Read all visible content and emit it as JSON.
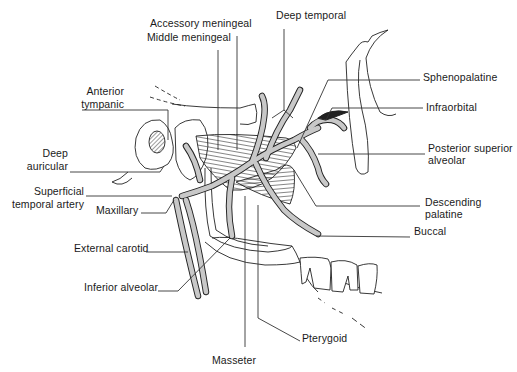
{
  "figure": {
    "colors": {
      "artery_fill": "#c8c8c8",
      "outline": "#222222",
      "leader": "#333333",
      "background": "#ffffff"
    }
  },
  "labels": [
    {
      "id": "accessory-meningeal",
      "text": "Accessory meningeal",
      "x": 150,
      "y": 18,
      "align": "left"
    },
    {
      "id": "middle-meningeal",
      "text": "Middle meningeal",
      "x": 147,
      "y": 32,
      "align": "left"
    },
    {
      "id": "deep-temporal",
      "text": "Deep temporal",
      "x": 276,
      "y": 10,
      "align": "left"
    },
    {
      "id": "sphenopalatine",
      "text": "Sphenopalatine",
      "x": 423,
      "y": 72,
      "align": "left"
    },
    {
      "id": "infraorbital",
      "text": "Infraorbital",
      "x": 426,
      "y": 102,
      "align": "left"
    },
    {
      "id": "posterior-superior-alveolar-line1",
      "text": "Posterior superior",
      "x": 428,
      "y": 143,
      "align": "left"
    },
    {
      "id": "posterior-superior-alveolar-line2",
      "text": "alveolar",
      "x": 428,
      "y": 155,
      "align": "left"
    },
    {
      "id": "descending-palatine-line1",
      "text": "Descending",
      "x": 425,
      "y": 197,
      "align": "left"
    },
    {
      "id": "descending-palatine-line2",
      "text": "palatine",
      "x": 425,
      "y": 209,
      "align": "left"
    },
    {
      "id": "buccal",
      "text": "Buccal",
      "x": 414,
      "y": 226,
      "align": "left"
    },
    {
      "id": "pterygoid",
      "text": "Pterygoid",
      "x": 302,
      "y": 333,
      "align": "left"
    },
    {
      "id": "masseter",
      "text": "Masseter",
      "x": 212,
      "y": 355,
      "align": "left"
    },
    {
      "id": "anterior-tympanic-line1",
      "text": "Anterior",
      "x": 44,
      "y": 86,
      "align": "right",
      "w": 80
    },
    {
      "id": "anterior-tympanic-line2",
      "text": "tympanic",
      "x": 40,
      "y": 99,
      "align": "right",
      "w": 84
    },
    {
      "id": "deep-auricular-line1",
      "text": "Deep",
      "x": 30,
      "y": 148,
      "align": "right",
      "w": 38
    },
    {
      "id": "deep-auricular-line2",
      "text": "auricular",
      "x": 22,
      "y": 161,
      "align": "right",
      "w": 46
    },
    {
      "id": "superficial-temporal-artery-line1",
      "text": "Superficial",
      "x": 30,
      "y": 186,
      "align": "right",
      "w": 54
    },
    {
      "id": "superficial-temporal-artery-line2",
      "text": "temporal artery",
      "x": 10,
      "y": 199,
      "align": "right",
      "w": 74
    },
    {
      "id": "maxillary",
      "text": "Maxillary",
      "x": 96,
      "y": 205,
      "align": "left"
    },
    {
      "id": "external-carotid",
      "text": "External carotid",
      "x": 74,
      "y": 243,
      "align": "left"
    },
    {
      "id": "inferior-alveolar",
      "text": "Inferior alveolar",
      "x": 84,
      "y": 282,
      "align": "left"
    }
  ],
  "leaders": [
    {
      "id": "accessory-meningeal-leader",
      "points": [
        [
          237,
          36
        ],
        [
          237,
          150
        ]
      ]
    },
    {
      "id": "middle-meningeal-leader",
      "points": [
        [
          218,
          50
        ],
        [
          218,
          150
        ]
      ]
    },
    {
      "id": "deep-temporal-leader",
      "points": [
        [
          284,
          29
        ],
        [
          284,
          110
        ],
        [
          272,
          118
        ]
      ]
    },
    {
      "id": "deep-temporal-leader-b",
      "points": [
        [
          284,
          110
        ],
        [
          293,
          118
        ]
      ]
    },
    {
      "id": "sphenopalatine-leader",
      "points": [
        [
          420,
          80
        ],
        [
          328,
          80
        ],
        [
          297,
          148
        ]
      ]
    },
    {
      "id": "infraorbital-leader",
      "points": [
        [
          423,
          108
        ],
        [
          332,
          108
        ],
        [
          326,
          120
        ]
      ]
    },
    {
      "id": "posterior-superior-alveolar-leader",
      "points": [
        [
          425,
          154
        ],
        [
          318,
          154
        ]
      ]
    },
    {
      "id": "descending-palatine-leader",
      "points": [
        [
          420,
          206
        ],
        [
          316,
          206
        ],
        [
          294,
          170
        ]
      ]
    },
    {
      "id": "buccal-leader",
      "points": [
        [
          410,
          237
        ],
        [
          316,
          236
        ]
      ]
    },
    {
      "id": "pterygoid-leader",
      "points": [
        [
          300,
          341
        ],
        [
          258,
          318
        ],
        [
          258,
          205
        ]
      ]
    },
    {
      "id": "masseter-leader",
      "points": [
        [
          245,
          347
        ],
        [
          245,
          196
        ]
      ]
    },
    {
      "id": "anterior-tympanic-leader",
      "points": [
        [
          82,
          110
        ],
        [
          168,
          110
        ],
        [
          168,
          140
        ]
      ]
    },
    {
      "id": "deep-auricular-leader",
      "points": [
        [
          70,
          172
        ],
        [
          160,
          172
        ],
        [
          164,
          166
        ]
      ]
    },
    {
      "id": "superficial-temporal-artery-leader",
      "points": [
        [
          86,
          196
        ],
        [
          172,
          196
        ]
      ]
    },
    {
      "id": "maxillary-leader",
      "points": [
        [
          141,
          213
        ],
        [
          166,
          213
        ],
        [
          174,
          200
        ]
      ]
    },
    {
      "id": "external-carotid-leader",
      "points": [
        [
          146,
          252
        ],
        [
          188,
          252
        ]
      ]
    },
    {
      "id": "inferior-alveolar-leader",
      "points": [
        [
          158,
          291
        ],
        [
          178,
          291
        ],
        [
          230,
          238
        ]
      ]
    }
  ]
}
